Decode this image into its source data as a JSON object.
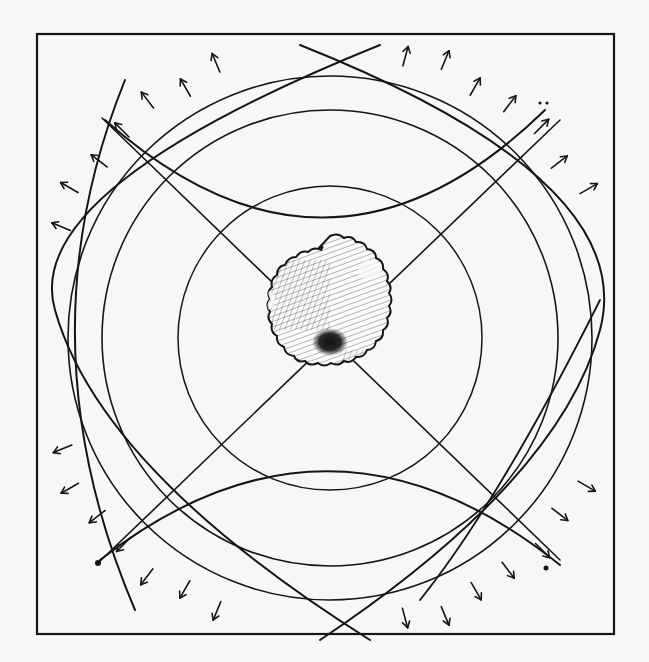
{
  "illustration": {
    "title": "Hand-drawn radiating circles diagram",
    "subject": "hatched central core surrounded by concentric circles, crossing diagonals, lens arcs and outward-pointing arrows",
    "colors": {
      "paper": "#f7f7f5",
      "ink": "#151515"
    },
    "frame": {
      "x": 37,
      "y": 34,
      "width": 577,
      "height": 600
    },
    "center": {
      "x": 330,
      "y": 338
    },
    "core": {
      "radius": 98,
      "label": "core"
    },
    "circles": [
      {
        "name": "inner-ring",
        "r": 152
      },
      {
        "name": "middle-ring",
        "r": 228
      },
      {
        "name": "outer-ring",
        "r": 262
      }
    ],
    "arrow_count": 48,
    "arrow_ring_radius": 295,
    "arrow_glyph": "arrow-outward-icon"
  }
}
